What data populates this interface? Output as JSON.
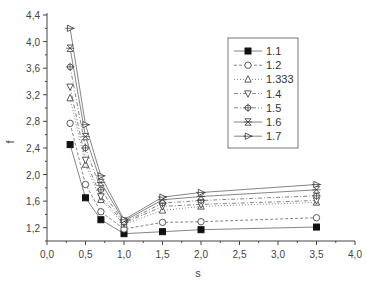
{
  "chart_data": {
    "type": "line",
    "title": "",
    "xlabel": "s",
    "ylabel": "f",
    "xlim": [
      0.0,
      4.0
    ],
    "ylim": [
      1.0,
      4.4
    ],
    "x_ticks": [
      "0,0",
      "0,5",
      "1,0",
      "1,5",
      "2,0",
      "2,5",
      "3,0",
      "3,5",
      "4,0"
    ],
    "y_ticks": [
      "1,2",
      "1,6",
      "2,0",
      "2,4",
      "2,8",
      "3,2",
      "3,6",
      "4,0",
      "4,4"
    ],
    "grid": false,
    "legend_position": "upper right (inside)",
    "x": [
      0.3,
      0.5,
      0.7,
      1.0,
      1.5,
      2.0,
      3.5
    ],
    "series": [
      {
        "name": "1.1",
        "marker": "filled-square",
        "line": "solid",
        "values": [
          2.45,
          1.65,
          1.32,
          1.11,
          1.14,
          1.17,
          1.21
        ]
      },
      {
        "name": "1.2",
        "marker": "circle",
        "line": "dashed",
        "values": [
          2.77,
          1.85,
          1.44,
          1.18,
          1.28,
          1.29,
          1.35
        ]
      },
      {
        "name": "1.333",
        "marker": "triangle-up",
        "line": "dotted",
        "values": [
          3.15,
          2.15,
          1.62,
          1.25,
          1.46,
          1.52,
          1.58
        ]
      },
      {
        "name": "1.4",
        "marker": "triangle-down",
        "line": "dash-dot",
        "values": [
          3.32,
          2.22,
          1.67,
          1.27,
          1.52,
          1.55,
          1.61
        ]
      },
      {
        "name": "1.5",
        "marker": "circle-cross",
        "line": "dash-dot",
        "values": [
          3.62,
          2.4,
          1.77,
          1.28,
          1.57,
          1.61,
          1.68
        ]
      },
      {
        "name": "1.6",
        "marker": "x-cross",
        "line": "solid",
        "values": [
          3.9,
          2.57,
          1.88,
          1.3,
          1.62,
          1.67,
          1.77
        ]
      },
      {
        "name": "1.7",
        "marker": "triangle-right",
        "line": "solid",
        "values": [
          4.2,
          2.75,
          1.98,
          1.32,
          1.66,
          1.73,
          1.85
        ]
      }
    ]
  },
  "colors": {
    "axis": "#444444",
    "line": "#666666",
    "marker": "#333333",
    "legend_border": "#555555"
  }
}
